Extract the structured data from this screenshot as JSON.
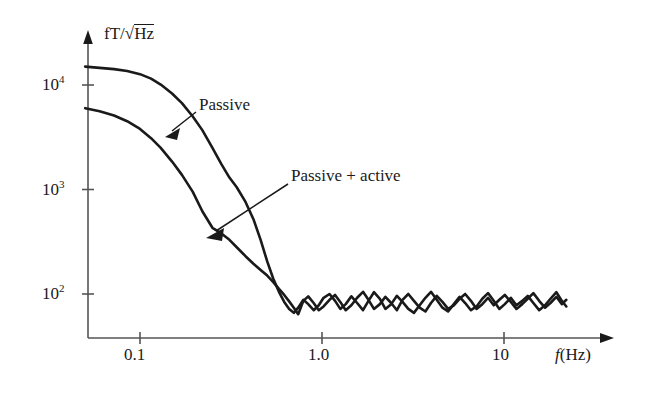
{
  "figure": {
    "background": "#ffffff",
    "ink": "#1a1a1a"
  },
  "axes": {
    "y_label_prefix": "fT/",
    "y_label_radical": "√",
    "y_label_radicand": "Hz",
    "y_ticks": [
      {
        "label_base": "10",
        "label_exp": "4",
        "value": 10000
      },
      {
        "label_base": "10",
        "label_exp": "3",
        "value": 1000
      },
      {
        "label_base": "10",
        "label_exp": "2",
        "value": 100
      }
    ],
    "x_ticks": [
      {
        "label": "0.1",
        "value": 0.1
      },
      {
        "label": "1.0",
        "value": 1.0
      },
      {
        "label": "10",
        "value": 10
      }
    ],
    "x_label_symbol": "f",
    "x_label_unit": "(Hz)"
  },
  "annotations": [
    {
      "name": "passive-label",
      "text": "Passive"
    },
    {
      "name": "passive-active-label",
      "text": "Passive + active"
    }
  ],
  "chart_data": {
    "type": "line",
    "title": "",
    "xlabel": "f (Hz)",
    "ylabel": "fT/√Hz",
    "xscale": "log",
    "yscale": "log",
    "xlim": [
      0.05,
      25
    ],
    "ylim": [
      50,
      30000
    ],
    "grid": false,
    "legend": "annotations-with-arrows",
    "series": [
      {
        "name": "Passive",
        "color": "#1a1a1a",
        "x": [
          0.05,
          0.06,
          0.072,
          0.085,
          0.1,
          0.115,
          0.13,
          0.15,
          0.17,
          0.195,
          0.22,
          0.25,
          0.28,
          0.31,
          0.34,
          0.38,
          0.42,
          0.46,
          0.5,
          0.54,
          0.58,
          0.62,
          0.66,
          0.7,
          0.74,
          0.79,
          0.84,
          0.9,
          0.96,
          1.02,
          1.1,
          1.18,
          1.26,
          1.35,
          1.45,
          1.56,
          1.68,
          1.8,
          1.93,
          2.08,
          2.23,
          2.4,
          2.58,
          2.77,
          2.98,
          3.2,
          3.44,
          3.7,
          3.97,
          4.27,
          4.59,
          4.93,
          5.3,
          5.7,
          6.12,
          6.58,
          7.07,
          7.6,
          8.17,
          8.78,
          9.43,
          10.1,
          10.9,
          11.7,
          12.6,
          13.5,
          14.5,
          15.6,
          16.8,
          18.0,
          19.4,
          20.8,
          22.0
        ],
        "y": [
          15000,
          14600,
          14200,
          13600,
          12700,
          11500,
          10100,
          8300,
          6700,
          5000,
          3700,
          2500,
          1750,
          1300,
          1050,
          760,
          520,
          330,
          205,
          140,
          105,
          84,
          72,
          66,
          74,
          88,
          80,
          70,
          78,
          92,
          100,
          86,
          72,
          80,
          95,
          82,
          70,
          86,
          104,
          90,
          72,
          80,
          96,
          84,
          72,
          66,
          78,
          92,
          105,
          88,
          74,
          68,
          80,
          94,
          82,
          70,
          76,
          90,
          102,
          86,
          72,
          80,
          92,
          78,
          86,
          96,
          82,
          70,
          78,
          90,
          104,
          86,
          76
        ]
      },
      {
        "name": "Passive + active",
        "color": "#1a1a1a",
        "x": [
          0.05,
          0.06,
          0.072,
          0.085,
          0.1,
          0.115,
          0.13,
          0.15,
          0.17,
          0.195,
          0.22,
          0.25,
          0.28,
          0.31,
          0.34,
          0.38,
          0.42,
          0.46,
          0.5,
          0.54,
          0.58,
          0.62,
          0.66,
          0.7,
          0.74,
          0.79,
          0.84,
          0.9,
          0.96,
          1.02,
          1.1,
          1.18,
          1.26,
          1.35,
          1.45,
          1.56,
          1.68,
          1.8,
          1.93,
          2.08,
          2.23,
          2.4,
          2.58,
          2.77,
          2.98,
          3.2,
          3.44,
          3.7,
          3.97,
          4.27,
          4.59,
          4.93,
          5.3,
          5.7,
          6.12,
          6.58,
          7.07,
          7.6,
          8.17,
          8.78,
          9.43,
          10.1,
          10.9,
          11.7,
          12.6,
          13.5,
          14.5,
          15.6,
          16.8,
          18.0,
          19.4,
          20.8,
          22.0
        ],
        "y": [
          6000,
          5600,
          5100,
          4500,
          3800,
          3100,
          2500,
          1850,
          1380,
          950,
          620,
          430,
          380,
          330,
          280,
          230,
          195,
          170,
          150,
          130,
          112,
          98,
          85,
          74,
          64,
          86,
          95,
          82,
          70,
          76,
          88,
          98,
          84,
          70,
          78,
          92,
          105,
          88,
          72,
          80,
          94,
          82,
          70,
          88,
          100,
          86,
          74,
          68,
          82,
          96,
          84,
          72,
          78,
          90,
          100,
          86,
          72,
          80,
          92,
          78,
          88,
          98,
          84,
          72,
          80,
          90,
          102,
          86,
          74,
          82,
          94,
          80,
          88
        ]
      }
    ]
  }
}
